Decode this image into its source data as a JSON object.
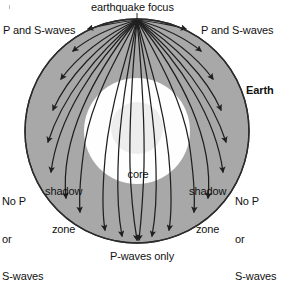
{
  "diagram": {
    "title": "earthquake focus",
    "labels": {
      "focus": "earthquake focus",
      "left_waves": "P and S-waves",
      "right_waves": "P and S-waves",
      "earth": "Earth",
      "left_no_waves_line1": "No P",
      "left_no_waves_line2": "or",
      "left_no_waves_line3": "S-waves",
      "right_no_waves_line1": "No P",
      "right_no_waves_line2": "or",
      "right_no_waves_line3": "S-waves",
      "left_shadow_line1": "shadow",
      "left_shadow_line2": "zone",
      "right_shadow_line1": "shadow",
      "right_shadow_line2": "zone",
      "core": "core",
      "bottom": "P-waves only"
    },
    "colors": {
      "mantle_fill": "#a8a8a8",
      "core_fill": "#fefefe",
      "inner_core_fill": "#ededed",
      "outline": "#2b2b2b",
      "ray": "#1f1f1f",
      "background": "#ffffff",
      "text": "#111111"
    },
    "geometry": {
      "earth_center_x": 137,
      "earth_center_y": 131,
      "earth_radius": 112,
      "core_radius": 53,
      "inner_core_radius": 26,
      "focus_x": 137,
      "focus_y": 19
    }
  }
}
